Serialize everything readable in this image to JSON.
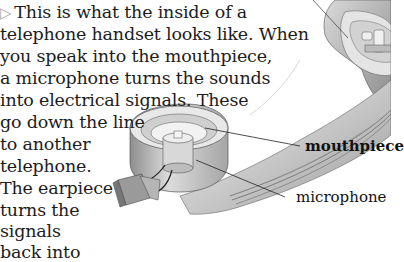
{
  "caption": {
    "bullet_icon": "triangle-right-outline",
    "lines": [
      "This is what the inside of a",
      "telephone handset looks like. When",
      "you speak into the mouthpiece,",
      "a microphone turns the sounds",
      "into electrical signals. These",
      "go down the line",
      "to another",
      "telephone.",
      "The earpiece",
      "turns the",
      "signals",
      "back into"
    ]
  },
  "labels": {
    "mouthpiece": "mouthpiece",
    "microphone": "microphone"
  },
  "colors": {
    "text": "#1c1c1c",
    "bullet": "#a8a8a8",
    "illustration_light": "#e6e6e6",
    "illustration_mid": "#b8b8b8",
    "illustration_dark": "#7a7a7a"
  }
}
